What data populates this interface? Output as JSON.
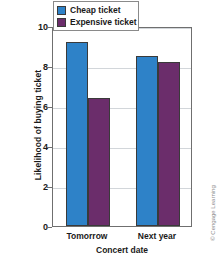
{
  "chart_data": {
    "type": "bar",
    "title": "",
    "xlabel": "Concert date",
    "ylabel": "Likelihood of buying ticket",
    "categories": [
      "Tomorrow",
      "Next year"
    ],
    "series": [
      {
        "name": "Cheap ticket",
        "color": "#2e82c8",
        "values": [
          9.2,
          8.5
        ]
      },
      {
        "name": "Expensive ticket",
        "color": "#6b2d6b",
        "values": [
          6.4,
          8.2
        ]
      }
    ],
    "ylim": [
      0,
      10
    ],
    "yticks": [
      0,
      2,
      4,
      6,
      8,
      10
    ],
    "ytick_labels": [
      "0",
      "2",
      "4",
      "6",
      "8",
      "10"
    ],
    "grid": true,
    "legend_position": "top-right-inside"
  },
  "credit": "© Cengage Learning"
}
